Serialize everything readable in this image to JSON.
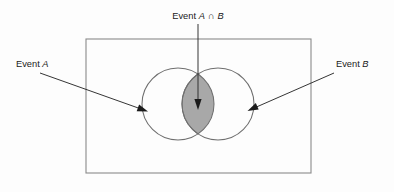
{
  "diagram": {
    "background_color": "#fdfdfd",
    "sample_space": {
      "name": "sample-space-rectangle",
      "x": 86,
      "y": 39,
      "width": 225,
      "height": 134,
      "stroke_color": "#8a8a8a",
      "fill": "none"
    },
    "circles": [
      {
        "id": "circle-a",
        "label": "Event A",
        "cx": 178,
        "cy": 104,
        "r": 36,
        "fill": "none",
        "stroke_color": "#6f6f6f"
      },
      {
        "id": "circle-b",
        "label": "Event B",
        "cx": 218,
        "cy": 104,
        "r": 36,
        "fill": "none",
        "stroke_color": "#6f6f6f"
      }
    ],
    "intersection": {
      "id": "intersection-lens",
      "label": "Event A ∩ B",
      "fill_color": "#a8a8a8",
      "stroke_color": "#6f6f6f",
      "x_left": 182,
      "x_right": 214,
      "y_top": 74,
      "y_bottom": 134
    },
    "labels": {
      "event_a": {
        "prefix": "Event ",
        "variable": "A",
        "full_text": "Event A",
        "x": 16,
        "y": 67,
        "anchor": "start"
      },
      "intersection": {
        "prefix": "Event ",
        "variable_a": "A",
        "operator": "∩",
        "variable_b": "B",
        "full_text": "Event A ∩ B",
        "x": 198,
        "y": 19,
        "anchor": "middle"
      },
      "event_b": {
        "prefix": "Event ",
        "variable": "B",
        "full_text": "Event B",
        "x": 336,
        "y": 67,
        "anchor": "start"
      }
    },
    "arrows": [
      {
        "id": "arrow-to-intersection",
        "from_label": "Event A ∩ B",
        "x1": 198,
        "y1": 24,
        "x2": 198,
        "y2": 103,
        "direction": "down"
      },
      {
        "id": "arrow-to-event-a",
        "from_label": "Event A",
        "x1": 40,
        "y1": 73,
        "x2": 144,
        "y2": 110,
        "direction": "down-right"
      },
      {
        "id": "arrow-to-event-b",
        "from_label": "Event B",
        "x1": 334,
        "y1": 73,
        "x2": 251,
        "y2": 109,
        "direction": "down-left"
      }
    ]
  }
}
